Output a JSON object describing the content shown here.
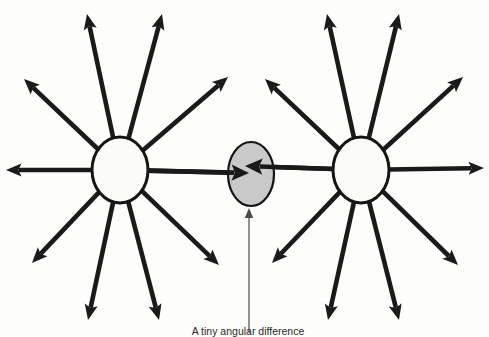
{
  "figure": {
    "title": "A tiny angular difference",
    "background_color": "#fdfdfb",
    "ink_color": "#1a1a1a",
    "node_fill_color": "#fbfbf8",
    "center_fill_color": "#c9c9c9",
    "leader_color": "#4a4a4a",
    "width": 489,
    "height": 337
  },
  "caption": {
    "text": "A tiny angular difference",
    "x": 248,
    "y": 335
  },
  "leader": {
    "name": "caption-leader",
    "x": 249,
    "y_start": 333,
    "y_end": 208
  },
  "nodes": [
    {
      "id": "left-node",
      "label": "Left source node",
      "cx": 120,
      "cy": 170,
      "rx": 28,
      "ry": 33
    },
    {
      "id": "right-node",
      "label": "Right source node",
      "cx": 361,
      "cy": 170,
      "rx": 28,
      "ry": 33
    }
  ],
  "center_target": {
    "id": "center-target",
    "label": "Convergence target",
    "cx": 251,
    "cy": 174,
    "rx": 23,
    "ry": 32,
    "fill": "#c9c9c9"
  },
  "chart_data": {
    "type": "diagram",
    "title": "A tiny angular difference",
    "ray_count_per_node": 10,
    "rays": {
      "left-node": [
        {
          "name": "ray-left-w",
          "tip_x": 6,
          "tip_y": 170,
          "angle_deg": 180
        },
        {
          "name": "ray-left-nw",
          "tip_x": 24,
          "tip_y": 79,
          "angle_deg": 145
        },
        {
          "name": "ray-left-nnw",
          "tip_x": 87,
          "tip_y": 14,
          "angle_deg": 103
        },
        {
          "name": "ray-left-nne",
          "tip_x": 162,
          "tip_y": 14,
          "angle_deg": 75
        },
        {
          "name": "ray-left-ne",
          "tip_x": 228,
          "tip_y": 77,
          "angle_deg": 42
        },
        {
          "name": "ray-left-e",
          "tip_x": 249,
          "tip_y": 173,
          "angle_deg": 0
        },
        {
          "name": "ray-left-se",
          "tip_x": 219,
          "tip_y": 265,
          "angle_deg": -44
        },
        {
          "name": "ray-left-sse",
          "tip_x": 159,
          "tip_y": 320,
          "angle_deg": -72
        },
        {
          "name": "ray-left-ssw",
          "tip_x": 88,
          "tip_y": 320,
          "angle_deg": -108
        },
        {
          "name": "ray-left-sw",
          "tip_x": 32,
          "tip_y": 263,
          "angle_deg": -138
        }
      ],
      "right-node": [
        {
          "name": "ray-right-w",
          "tip_x": 245,
          "tip_y": 166,
          "angle_deg": 181
        },
        {
          "name": "ray-right-nw",
          "tip_x": 265,
          "tip_y": 79,
          "angle_deg": 145
        },
        {
          "name": "ray-right-nnw",
          "tip_x": 327,
          "tip_y": 14,
          "angle_deg": 103
        },
        {
          "name": "ray-right-nne",
          "tip_x": 399,
          "tip_y": 14,
          "angle_deg": 75
        },
        {
          "name": "ray-right-ne",
          "tip_x": 463,
          "tip_y": 77,
          "angle_deg": 42
        },
        {
          "name": "ray-right-e",
          "tip_x": 484,
          "tip_y": 168,
          "angle_deg": 0
        },
        {
          "name": "ray-right-se",
          "tip_x": 458,
          "tip_y": 265,
          "angle_deg": -44
        },
        {
          "name": "ray-right-sse",
          "tip_x": 399,
          "tip_y": 320,
          "angle_deg": -72
        },
        {
          "name": "ray-right-ssw",
          "tip_x": 328,
          "tip_y": 320,
          "angle_deg": -108
        },
        {
          "name": "ray-right-sw",
          "tip_x": 272,
          "tip_y": 263,
          "angle_deg": -138
        }
      ]
    }
  }
}
